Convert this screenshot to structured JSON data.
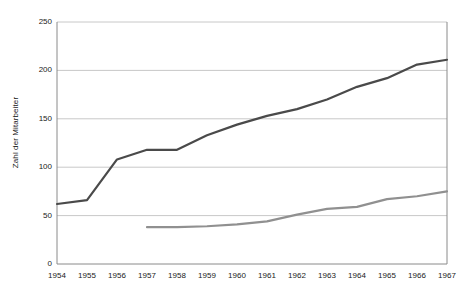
{
  "chart_data": {
    "type": "line",
    "title": "",
    "xlabel": "",
    "ylabel": "Zahl der Mitarbeiter",
    "categories": [
      "1954",
      "1955",
      "1956",
      "1957",
      "1958",
      "1959",
      "1960",
      "1961",
      "1962",
      "1963",
      "1964",
      "1965",
      "1966",
      "1967"
    ],
    "x": [
      1954,
      1955,
      1956,
      1957,
      1958,
      1959,
      1960,
      1961,
      1962,
      1963,
      1964,
      1965,
      1966,
      1967
    ],
    "ylim": [
      0,
      250
    ],
    "yticks": [
      0,
      50,
      100,
      150,
      200,
      250
    ],
    "ytick_labels": [
      "0",
      "50",
      "100",
      "150",
      "200",
      "250"
    ],
    "grid": "horizontal",
    "legend": "none",
    "series": [
      {
        "name": "series-dark",
        "color": "#4a4a4a",
        "values": [
          62,
          66,
          108,
          118,
          118,
          133,
          144,
          153,
          160,
          170,
          183,
          192,
          206,
          211
        ]
      },
      {
        "name": "series-gray",
        "color": "#909090",
        "values": [
          null,
          null,
          null,
          38,
          38,
          39,
          41,
          44,
          51,
          57,
          59,
          67,
          70,
          75
        ]
      }
    ]
  },
  "axes": {
    "y_title": "Zahl der Mitarbeiter"
  }
}
